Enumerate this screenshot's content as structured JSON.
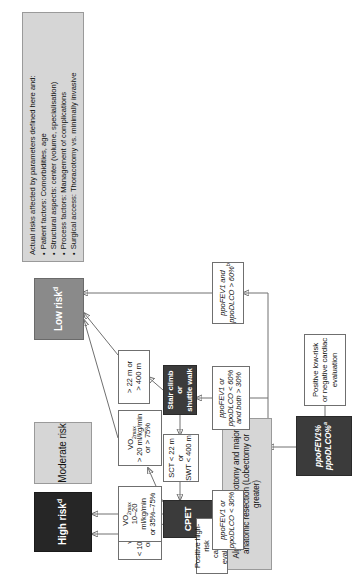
{
  "figure": {
    "title_box": "Algorithm for thoracotomy and major anatomic resection (Lobectomy or greater)"
  },
  "nodes": {
    "title": "Algorithm for thoracotomy and major anatomic resection (Lobectomy or greater)",
    "high_risk": "High risk",
    "high_risk_sup": "d",
    "moderate_risk": "Moderate risk",
    "low_risk": "Low risk",
    "low_risk_sup": "d",
    "vo2_low_l1": "VO",
    "vo2_low_sub": "2max",
    "vo2_low_l2": "< 10 ml/kg/min",
    "vo2_low_l3": "or < 35%",
    "vo2_mid_l2": "10–20 ml/kg/min",
    "vo2_mid_l3": "or 35%–75%",
    "vo2_high_l2": "> 20 ml/kg/min",
    "vo2_high_l3": "or > 75%",
    "walk_pass_l1": "> 22 m or",
    "walk_pass_l2": "> 400 m",
    "cpet": "CPET",
    "sct_swt_l1": "SCT < 22 m or",
    "sct_swt_l2": "SWT < 400 m",
    "stair_l1": "Stair climb or",
    "stair_l2": "shuttle walk",
    "pos_high_l1": "Positive high-risk",
    "pos_high_l2": "cardiac evaluation",
    "pos_high_sup": "c",
    "ppo_lt30_l1": "ppoFEV1 or",
    "ppo_lt30_l2": "ppoDLCO < 30%",
    "ppo_mid_l1": "ppoFEV1 or",
    "ppo_mid_l2": "ppoDLCO < 60%",
    "ppo_mid_l3": "and both > 30%",
    "ppo_gt60_l1": "ppoFEV1 and",
    "ppo_gt60_l2": "ppoDLCO > 60%",
    "ppo_gt60_sup": "b",
    "pos_low_l1": "Positive low-risk",
    "pos_low_l2": "or negative cardiac",
    "pos_low_l3": "evaluation",
    "ppo_entry_l1": "ppoFEV1%",
    "ppo_entry_l2": "ppoDLCO%",
    "ppo_entry_sup": "a"
  },
  "legend": {
    "heading": "Actual risks affected by parameters defined here and:",
    "items": [
      "Patient factors: Comorbidities, age",
      "Structural aspects: center (volume, specialisation)",
      "Process factors: Management of complications",
      "Surgical access: Thoracotomy vs. minimally invasive"
    ]
  },
  "colors": {
    "high_risk_fill": "#262626",
    "moderate_risk_fill": "#d6d6d6",
    "low_risk_fill": "#8a8a8a",
    "cpet_fill": "#3b3b3b",
    "stair_fill": "#3b3b3b",
    "entry_fill": "#3b3b3b",
    "title_fill": "#d6d6d6",
    "legend_fill": "#d6d6d6",
    "edge_stroke": "#707070"
  }
}
